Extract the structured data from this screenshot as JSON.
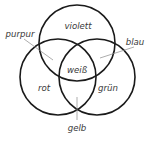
{
  "diagram": {
    "type": "venn",
    "circles": [
      {
        "id": "top",
        "region_label": "violett"
      },
      {
        "id": "left",
        "region_label": "rot"
      },
      {
        "id": "right",
        "region_label": "grün"
      }
    ],
    "labels": {
      "top": "violett",
      "left": "rot",
      "right": "grün",
      "top_left": "purpur",
      "top_right": "blau",
      "left_right": "gelb",
      "center": "weiß"
    },
    "colors": {
      "outline": "#1a1a1a",
      "leader": "#8a8a8a",
      "text": "#3a3a3a",
      "background": "#ffffff"
    }
  }
}
